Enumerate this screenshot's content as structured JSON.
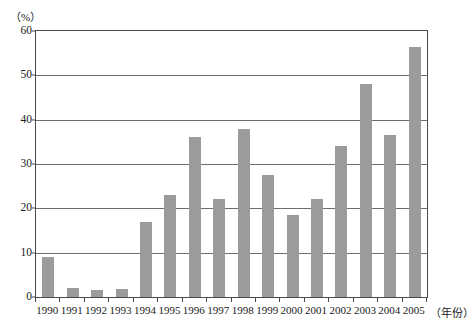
{
  "chart_data": {
    "type": "bar",
    "title": "",
    "subtitle": "",
    "xlabel": "（年份）",
    "ylabel": "（%）",
    "categories": [
      "1990",
      "1991",
      "1992",
      "1993",
      "1994",
      "1995",
      "1996",
      "1997",
      "1998",
      "1999",
      "2000",
      "2001",
      "2002",
      "2003",
      "2004",
      "2005"
    ],
    "values": [
      9,
      2,
      1.5,
      1.7,
      17,
      23,
      36,
      22,
      38,
      27.5,
      18.5,
      22,
      34,
      48,
      36.5,
      56.5
    ],
    "ylim": [
      0,
      60
    ],
    "ytick_labels": [
      "0",
      "10",
      "20",
      "30",
      "40",
      "50",
      "60"
    ],
    "ytick_values": [
      0,
      10,
      20,
      30,
      40,
      50,
      60
    ],
    "grid": true,
    "legend": "none",
    "bar_color": "#9b9b9b",
    "axis_color": "#4a4a4a",
    "grid_color": "#6e6e6e",
    "background_color": "#ffffff"
  }
}
